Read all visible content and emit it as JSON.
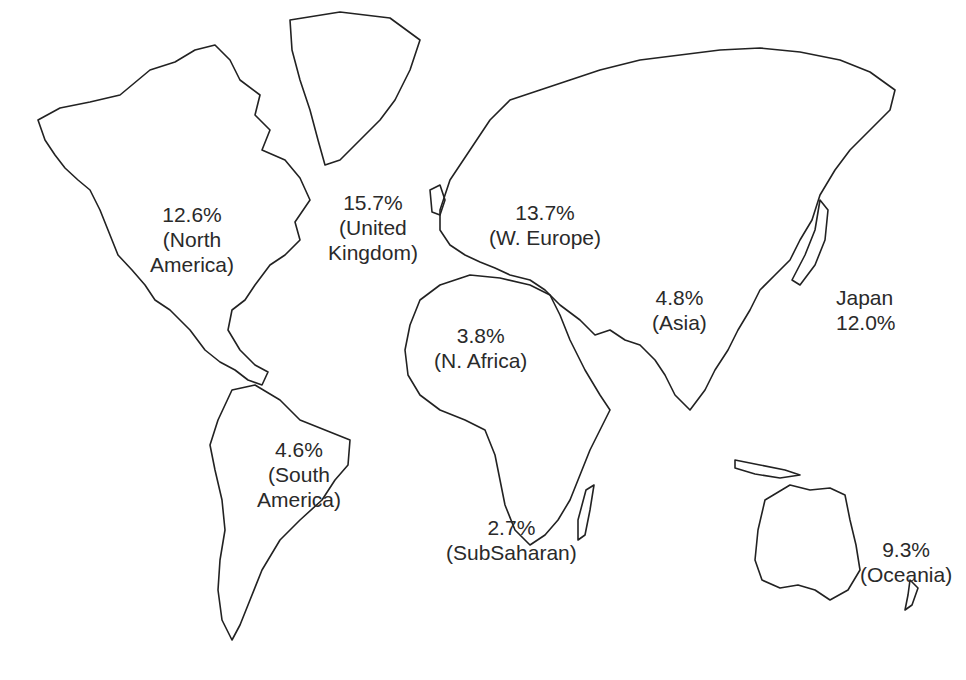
{
  "map": {
    "type": "world outline map",
    "regions": [
      {
        "id": "north-america",
        "percent": "12.6%",
        "name": "(North",
        "name2": "America)"
      },
      {
        "id": "united-kingdom",
        "percent": "15.7%",
        "name": "(United",
        "name2": "Kingdom)"
      },
      {
        "id": "w-europe",
        "percent": "13.7%",
        "name": "(W. Europe)"
      },
      {
        "id": "asia",
        "percent": "4.8%",
        "name": "(Asia)"
      },
      {
        "id": "japan",
        "name": "Japan",
        "percent": "12.0%"
      },
      {
        "id": "n-africa",
        "percent": "3.8%",
        "name": "(N. Africa)"
      },
      {
        "id": "south-america",
        "percent": "4.6%",
        "name": "(South",
        "name2": "America)"
      },
      {
        "id": "subsaharan",
        "percent": "2.7%",
        "name": "(SubSaharan)"
      },
      {
        "id": "oceania",
        "percent": "9.3%",
        "name": "(Oceania)"
      }
    ]
  },
  "colors": {
    "outline": "#222222",
    "text": "#2a2a2a",
    "background": "#ffffff"
  }
}
